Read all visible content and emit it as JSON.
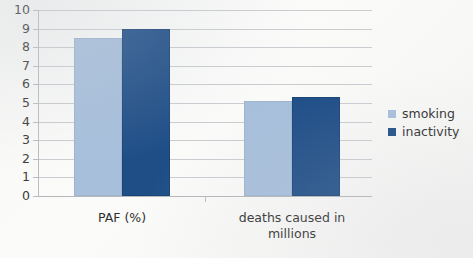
{
  "chart_data": {
    "type": "bar",
    "title": "",
    "xlabel": "",
    "ylabel": "",
    "ylim": [
      0,
      10
    ],
    "ytick_step": 1,
    "yticks": [
      "10",
      "9",
      "8",
      "7",
      "6",
      "5",
      "4",
      "3",
      "2",
      "1",
      "0"
    ],
    "grid": true,
    "legend_position": "right",
    "categories": [
      "PAF (%)",
      "deaths caused in millions"
    ],
    "category_lines": [
      [
        "PAF (%)"
      ],
      [
        "deaths caused in",
        "millions"
      ]
    ],
    "series": [
      {
        "name": "smoking",
        "color": "#a7bfdb",
        "values": [
          8.5,
          5.1
        ]
      },
      {
        "name": "inactivity",
        "color": "#1f4e87",
        "values": [
          9.0,
          5.3
        ]
      }
    ]
  },
  "legend": {
    "items": [
      {
        "label": "smoking",
        "swatch": "legend-swatch-smoking"
      },
      {
        "label": "inactivity",
        "swatch": "legend-swatch-inactivity"
      }
    ]
  },
  "colors": {
    "smoking": "#a7bfdb",
    "inactivity": "#1f4e87",
    "gridline": "#c9cdd2",
    "axis": "#b9bdc2",
    "text": "#2f2f2f",
    "background": "#f7f7f5"
  }
}
